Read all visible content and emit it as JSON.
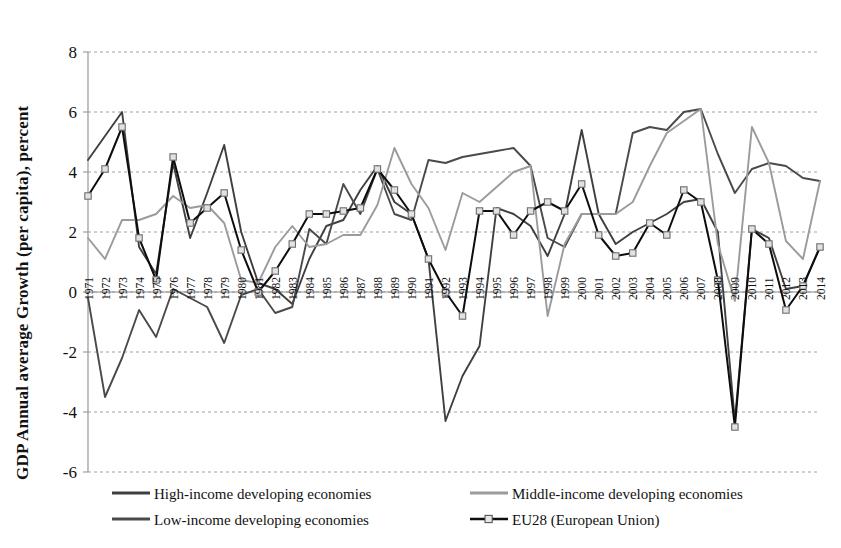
{
  "chart_data": {
    "type": "line",
    "title": "",
    "xlabel": "",
    "ylabel": "GDP Annual average Growth (per capita), percent",
    "ylim": [
      -6,
      8
    ],
    "yticks": [
      -6,
      -4,
      -2,
      0,
      2,
      4,
      6,
      8
    ],
    "grid": true,
    "legend_position": "bottom",
    "x": [
      1971,
      1972,
      1973,
      1974,
      1975,
      1976,
      1977,
      1978,
      1979,
      1980,
      1981,
      1982,
      1983,
      1984,
      1985,
      1986,
      1987,
      1988,
      1989,
      1990,
      1991,
      1992,
      1993,
      1994,
      1995,
      1996,
      1997,
      1998,
      1999,
      2000,
      2001,
      2002,
      2003,
      2004,
      2005,
      2006,
      2007,
      2008,
      2009,
      2010,
      2011,
      2012,
      2013,
      2014
    ],
    "categories": [
      "1971",
      "1972",
      "1973",
      "1974",
      "1975",
      "1976",
      "1977",
      "1978",
      "1979",
      "1980",
      "1981",
      "1982",
      "1983",
      "1984",
      "1985",
      "1986",
      "1987",
      "1988",
      "1989",
      "1990",
      "1991",
      "1992",
      "1993",
      "1994",
      "1995",
      "1996",
      "1997",
      "1998",
      "1999",
      "2000",
      "2001",
      "2002",
      "2003",
      "2004",
      "2005",
      "2006",
      "2007",
      "2008",
      "2009",
      "2010",
      "2011",
      "2012",
      "2013",
      "2014"
    ],
    "series": [
      {
        "name": "High-income developing economies",
        "color": "#3f3f3f",
        "marker": "none",
        "values": [
          4.4,
          5.2,
          6.0,
          1.5,
          0.6,
          4.3,
          1.8,
          3.3,
          4.9,
          2.0,
          0.3,
          0.1,
          -0.4,
          1.1,
          2.2,
          2.4,
          3.4,
          4.2,
          3.0,
          2.6,
          1.1,
          -4.3,
          -2.8,
          -1.8,
          2.8,
          2.6,
          2.2,
          1.2,
          2.6,
          5.4,
          2.6,
          1.6,
          2.0,
          2.3,
          2.6,
          3.0,
          3.1,
          2.0,
          -4.3,
          2.1,
          1.8,
          0.1,
          0.2,
          1.5
        ]
      },
      {
        "name": "Low-income developing economies",
        "color": "#4a4a4a",
        "marker": "none",
        "values": [
          -0.2,
          -3.5,
          -2.2,
          -0.6,
          -1.5,
          0.1,
          -0.2,
          -0.5,
          -1.7,
          -0.1,
          0.1,
          -0.7,
          -0.5,
          2.1,
          1.6,
          3.6,
          2.6,
          4.1,
          2.6,
          2.4,
          4.4,
          4.3,
          4.5,
          4.6,
          4.7,
          4.8,
          4.2,
          1.8,
          1.5,
          2.6,
          2.6,
          2.6,
          5.3,
          5.5,
          5.4,
          6.0,
          6.1,
          4.6,
          3.3,
          4.1,
          4.3,
          4.2,
          3.8,
          3.7
        ]
      },
      {
        "name": "Middle-income developing economies",
        "color": "#9b9b9b",
        "marker": "none",
        "values": [
          1.8,
          1.1,
          2.4,
          2.4,
          2.6,
          3.2,
          2.8,
          2.9,
          2.3,
          0.4,
          0.3,
          1.5,
          2.2,
          1.5,
          1.6,
          1.9,
          1.9,
          2.9,
          4.8,
          3.6,
          2.8,
          1.4,
          3.3,
          3.0,
          3.5,
          4.0,
          4.2,
          -0.8,
          1.6,
          2.6,
          2.6,
          2.6,
          3.0,
          4.2,
          5.3,
          5.7,
          6.1,
          1.6,
          -0.3,
          5.5,
          4.3,
          1.7,
          1.1,
          3.7
        ]
      },
      {
        "name": "EU28 (European Union)",
        "color": "#0d0d0d",
        "marker": "square",
        "values": [
          3.2,
          4.1,
          5.5,
          1.8,
          0.4,
          4.5,
          2.3,
          2.8,
          3.3,
          1.4,
          0.0,
          0.7,
          1.6,
          2.6,
          2.6,
          2.7,
          2.8,
          4.1,
          3.4,
          2.6,
          1.1,
          0.0,
          -0.8,
          2.7,
          2.7,
          1.9,
          2.7,
          3.0,
          2.7,
          3.6,
          1.9,
          1.2,
          1.3,
          2.3,
          1.9,
          3.4,
          3.0,
          0.4,
          -4.5,
          2.1,
          1.6,
          -0.6,
          0.2,
          1.5
        ]
      }
    ]
  },
  "axis": {
    "ytitle": "GDP Annual average Growth (per capita), percent",
    "yticklabels": [
      "8",
      "6",
      "4",
      "2",
      "0",
      "-2",
      "-4",
      "-6"
    ]
  },
  "legend": {
    "items": [
      {
        "label": "High-income developing economies",
        "color": "#3f3f3f",
        "marker": "none"
      },
      {
        "label": "Middle-income developing economies",
        "color": "#9b9b9b",
        "marker": "none"
      },
      {
        "label": "Low-income developing economies",
        "color": "#4a4a4a",
        "marker": "none"
      },
      {
        "label": "EU28 (European Union)",
        "color": "#0d0d0d",
        "marker": "square"
      }
    ]
  }
}
